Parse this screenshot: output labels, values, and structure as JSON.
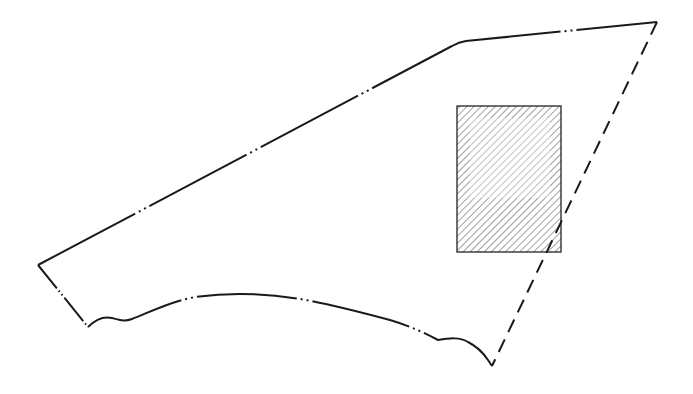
{
  "figure": {
    "type": "patent-line-drawing",
    "colors": {
      "background": "#ffffff",
      "stroke": "#1a1a1a",
      "hatch": "#333333"
    },
    "outline": {
      "style": "phantom (long dash - dot - dot)",
      "vertices": [
        {
          "name": "left-corner",
          "x": 38,
          "y": 265
        },
        {
          "name": "upper-bend",
          "x": 466,
          "y": 41
        },
        {
          "name": "top-right-corner",
          "x": 657,
          "y": 22
        },
        {
          "name": "bottom-right-corner",
          "x": 492,
          "y": 366
        },
        {
          "name": "bottom-left-corner",
          "x": 88,
          "y": 327
        }
      ]
    },
    "dashed_edge": {
      "style": "dashed",
      "from": {
        "x": 657,
        "y": 22
      },
      "to": {
        "x": 492,
        "y": 366
      }
    },
    "hatched_region": {
      "shape": "rectangle",
      "x": 457,
      "y": 106,
      "width": 104,
      "height": 146,
      "fill": "diagonal hatching"
    },
    "labels": []
  }
}
